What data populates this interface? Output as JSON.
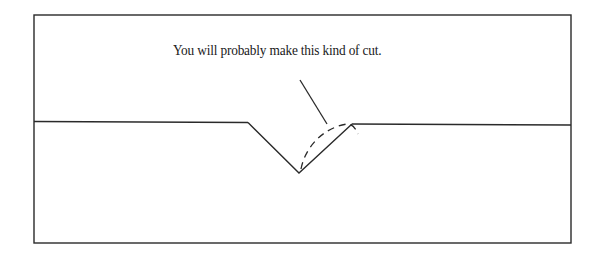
{
  "diagram": {
    "caption": "You will probably make this kind of cut.",
    "colors": {
      "line": "#2a2a2a",
      "background": "#ffffff"
    },
    "frame": {
      "x1": 34,
      "y1": 15,
      "x2": 571,
      "y2": 243
    },
    "surface_left": {
      "x1": 34,
      "y1": 121,
      "x2": 248,
      "y2": 122
    },
    "v_cut": {
      "left_top": [
        248,
        122
      ],
      "bottom": [
        299,
        173
      ],
      "right_top": [
        352,
        124
      ]
    },
    "surface_right": {
      "x1": 352,
      "y1": 124,
      "x2": 571,
      "y2": 125
    },
    "leader_line": {
      "from": [
        300,
        80
      ],
      "to": [
        327,
        124
      ]
    },
    "dashed_cut_curve": "actual cut profile (dashed)"
  }
}
